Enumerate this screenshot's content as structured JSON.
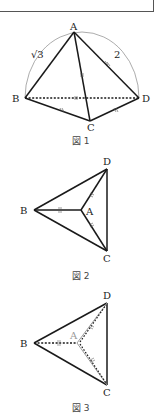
{
  "figure1": {
    "caption": "図 1",
    "vertices": {
      "A": "A",
      "B": "B",
      "C": "C",
      "D": "D"
    },
    "edge_labels": {
      "AB": "√3",
      "AD": "2"
    },
    "coords": {
      "A": [
        74,
        32
      ],
      "B": [
        25,
        98
      ],
      "C": [
        90,
        121
      ],
      "D": [
        139,
        98
      ]
    }
  },
  "figure2": {
    "caption": "図 2",
    "vertices": {
      "A": "A",
      "B": "B",
      "C": "C",
      "D": "D"
    },
    "coords": {
      "A": [
        81,
        210
      ],
      "B": [
        34,
        210
      ],
      "C": [
        107,
        251
      ],
      "D": [
        107,
        169
      ]
    }
  },
  "figure3": {
    "caption": "図 3",
    "vertices": {
      "A": "A",
      "B": "B",
      "C": "C",
      "D": "D"
    },
    "coords": {
      "A": [
        77,
        343
      ],
      "B": [
        34,
        343
      ],
      "C": [
        107,
        385
      ],
      "D": [
        107,
        303
      ]
    }
  },
  "colors": {
    "line": "#1a1a1a",
    "arc": "#888888",
    "faded": "#9a9a9a"
  }
}
